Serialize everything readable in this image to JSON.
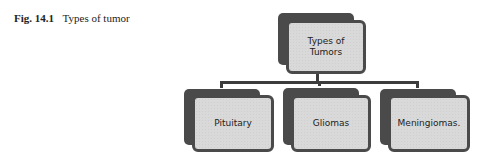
{
  "caption": {
    "number": "Fig. 14.1",
    "title": "Types of tumor"
  },
  "diagram": {
    "root": {
      "label_line1": "Types of",
      "label_line2": "Tumors"
    },
    "children": [
      {
        "label": "Pituitary"
      },
      {
        "label": "Gliomas"
      },
      {
        "label": "Meningiomas."
      }
    ],
    "colors": {
      "box_fill": "#d9d9d9",
      "box_border": "#4a4a4a",
      "connector": "#3c3c3c"
    }
  }
}
